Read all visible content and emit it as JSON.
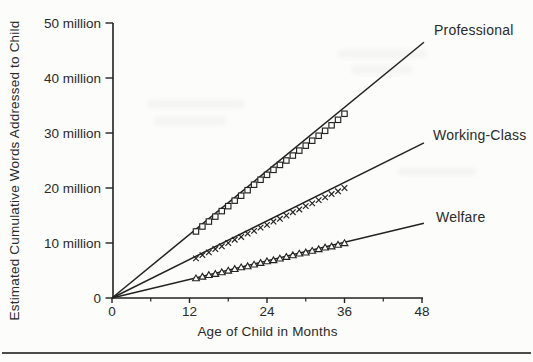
{
  "figure": {
    "background": "#fcfcfa",
    "ink": "#222222",
    "text_color": "#2a2a2a"
  },
  "chart_data": {
    "type": "scatter",
    "title": "",
    "xlabel": "Age of Child in Months",
    "ylabel": "Estimated Cumulative Words Addressed to Child",
    "x_unit": "months",
    "y_unit": "millions of words",
    "xlim": [
      0,
      48
    ],
    "ylim_millions": [
      0,
      50
    ],
    "grid": false,
    "legend_position": "right-of-lines",
    "x_ticks": [
      {
        "v": 0,
        "label": "0"
      },
      {
        "v": 12,
        "label": "12"
      },
      {
        "v": 24,
        "label": "24"
      },
      {
        "v": 36,
        "label": "36"
      },
      {
        "v": 48,
        "label": "48"
      }
    ],
    "x_minor_ticks": [
      6,
      18,
      30,
      42
    ],
    "y_ticks": [
      {
        "v": 0,
        "label": "0"
      },
      {
        "v": 10,
        "label": "10 million"
      },
      {
        "v": 20,
        "label": "20 million"
      },
      {
        "v": 30,
        "label": "30 million"
      },
      {
        "v": 40,
        "label": "40 million"
      },
      {
        "v": 50,
        "label": "50 million"
      }
    ],
    "series": [
      {
        "name": "Professional",
        "marker": "square",
        "months": [
          13,
          14,
          15,
          16,
          17,
          18,
          19,
          20,
          21,
          22,
          23,
          24,
          25,
          26,
          27,
          28,
          29,
          30,
          31,
          32,
          33,
          34,
          35,
          36
        ],
        "values_millions": [
          12.1,
          13.0,
          13.9,
          14.8,
          15.8,
          16.7,
          17.7,
          18.6,
          19.6,
          20.6,
          21.5,
          22.4,
          23.3,
          24.2,
          25.0,
          25.9,
          26.8,
          27.7,
          28.6,
          29.5,
          30.4,
          31.4,
          32.4,
          33.5
        ],
        "trend_line": {
          "from_month": 0,
          "from_value": 0,
          "to_month": 48.3,
          "to_value": 46.5
        }
      },
      {
        "name": "Working-Class",
        "marker": "cross",
        "months": [
          13,
          14,
          15,
          16,
          17,
          18,
          19,
          20,
          21,
          22,
          23,
          24,
          25,
          26,
          27,
          28,
          29,
          30,
          31,
          32,
          33,
          34,
          35,
          36
        ],
        "values_millions": [
          7.2,
          7.8,
          8.3,
          8.9,
          9.4,
          10.0,
          10.6,
          11.1,
          11.7,
          12.2,
          12.8,
          13.3,
          13.9,
          14.4,
          15.0,
          15.6,
          16.1,
          16.7,
          17.2,
          17.8,
          18.3,
          18.9,
          19.4,
          20.0
        ],
        "trend_line": {
          "from_month": 0,
          "from_value": 0,
          "to_month": 48.3,
          "to_value": 28.2
        }
      },
      {
        "name": "Welfare",
        "marker": "triangle",
        "months": [
          13,
          14,
          15,
          16,
          17,
          18,
          19,
          20,
          21,
          22,
          23,
          24,
          25,
          26,
          27,
          28,
          29,
          30,
          31,
          32,
          33,
          34,
          35,
          36
        ],
        "values_millions": [
          3.6,
          3.9,
          4.2,
          4.4,
          4.7,
          5.0,
          5.3,
          5.6,
          5.8,
          6.1,
          6.4,
          6.7,
          6.9,
          7.2,
          7.5,
          7.8,
          8.1,
          8.3,
          8.6,
          8.9,
          9.2,
          9.4,
          9.7,
          10.0
        ],
        "trend_line": {
          "from_month": 0,
          "from_value": 0,
          "to_month": 48.3,
          "to_value": 13.6
        }
      }
    ]
  }
}
